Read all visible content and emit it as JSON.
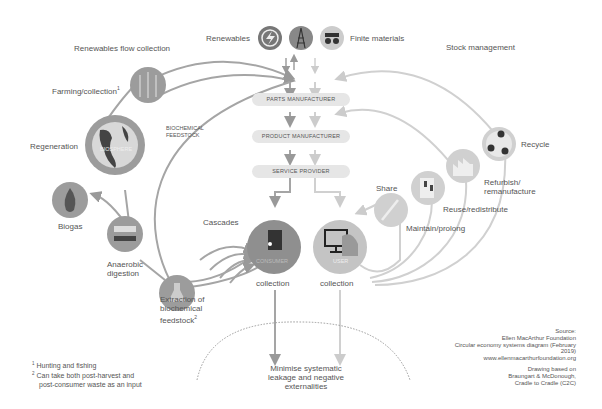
{
  "header": {
    "renewables": "Renewables",
    "finite_materials": "Finite materials",
    "renewables_flow_collection": "Renewables flow collection",
    "stock_management": "Stock management"
  },
  "center": {
    "parts_manufacturer": "PARTS MANUFACTURER",
    "product_manufacturer": "PRODUCT MANUFACTURER",
    "service_provider": "SERVICE PROVIDER",
    "consumer": "CONSUMER",
    "user": "USER",
    "consumer_collection": "collection",
    "user_collection": "collection",
    "minimise": "Minimise systematic\nleakage and negative\nexternalities"
  },
  "biological": {
    "farming": "Farming/collection",
    "farming_note": "1",
    "biosphere": "BIOSPHERE",
    "regeneration": "Regeneration",
    "biochemical_feedstock": "BIOCHEMICAL\nFEEDSTOCK",
    "biogas": "Biogas",
    "anaerobic": "Anaerobic\ndigestion",
    "cascades": "Cascades",
    "extraction": "Extraction of\nbiochemical\nfeedstock",
    "extraction_note": "2"
  },
  "technical": {
    "share": "Share",
    "maintain": "Maintain/prolong",
    "reuse": "Reuse/redistribute",
    "refurbish": "Refurbish/\nremanufacture",
    "recycle": "Recycle"
  },
  "footnotes": {
    "note1_num": "1",
    "note1": "Hunting and fishing",
    "note2_num": "2",
    "note2a": "Can take both post-harvest and",
    "note2b": "post-consumer waste as an input"
  },
  "source": {
    "l1": "Source:",
    "l2": "Ellen MacArthur Foundation",
    "l3": "Circular economy systems diagram (February",
    "l4": "2019)",
    "l5": "www.ellenmacarthurfoundation.org",
    "l6": "Drawing based on",
    "l7": "Braungart & McDonough,",
    "l8": "Cradle to Cradle (C2C)"
  },
  "colors": {
    "bio_dark": "#8a8a8a",
    "bio_circle": "#9c9c9c",
    "tech_light": "#cfcfcf",
    "tech_circle": "#d6d6d6",
    "pill": "#e6e6e6",
    "text": "#555555"
  }
}
